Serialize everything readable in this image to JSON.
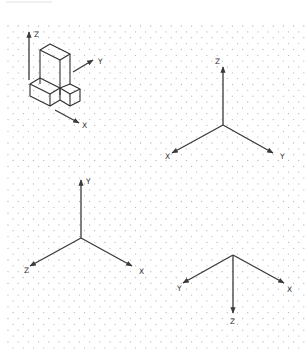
{
  "figure": {
    "colors": {
      "line": "#3a3a3a",
      "grid_dot": "#b8b8b8",
      "background": "#ffffff"
    }
  },
  "panels": [
    {
      "id": "block-figure",
      "axes": {
        "z": "Z",
        "y": "Y",
        "x": "X"
      }
    },
    {
      "id": "axes-z-up",
      "axes": {
        "z": "Z",
        "x": "X",
        "y": "Y"
      }
    },
    {
      "id": "axes-y-up",
      "axes": {
        "y": "Y",
        "z": "Z",
        "x": "X"
      }
    },
    {
      "id": "axes-z-down",
      "axes": {
        "y": "Y",
        "x": "X",
        "z": "Z"
      }
    }
  ]
}
